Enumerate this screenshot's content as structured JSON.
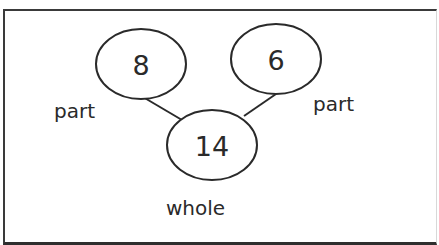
{
  "diagram": {
    "type": "number-bond",
    "parts": [
      {
        "value": "8",
        "label": "part"
      },
      {
        "value": "6",
        "label": "part"
      }
    ],
    "whole": {
      "value": "14",
      "label": "whole"
    },
    "colors": {
      "stroke": "#2a2a2a",
      "background": "#ffffff",
      "frame": "#3a3a3a"
    }
  }
}
